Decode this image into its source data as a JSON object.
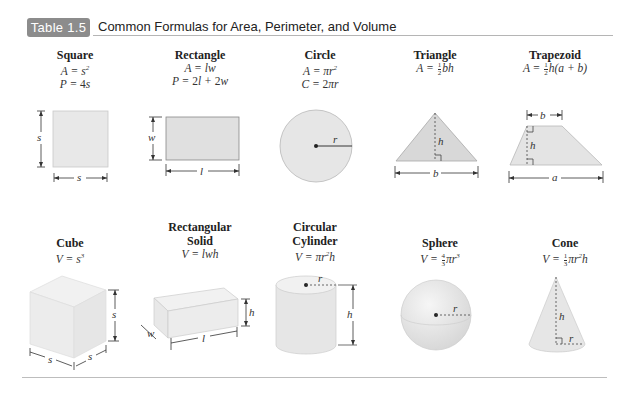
{
  "header": {
    "badge": "Table 1.5",
    "title": "Common Formulas for Area, Perimeter, and Volume"
  },
  "row1": [
    {
      "name": "Square",
      "formulas": [
        "A = s²",
        "P = 4s"
      ],
      "labels": {
        "side_v": "s",
        "side_h": "s"
      }
    },
    {
      "name": "Rectangle",
      "formulas": [
        "A = lw",
        "P = 2l + 2w"
      ],
      "labels": {
        "width": "w",
        "length": "l"
      }
    },
    {
      "name": "Circle",
      "formulas": [
        "A = πr²",
        "C = 2πr"
      ],
      "labels": {
        "radius": "r"
      }
    },
    {
      "name": "Triangle",
      "formulas": [
        "A = ½bh"
      ],
      "labels": {
        "height": "h",
        "base": "b"
      }
    },
    {
      "name": "Trapezoid",
      "formulas": [
        "A = ½h(a + b)"
      ],
      "labels": {
        "top": "b",
        "height": "h",
        "bottom": "a"
      }
    }
  ],
  "row2": [
    {
      "name": "Cube",
      "formulas": [
        "V = s³"
      ],
      "labels": {
        "height": "s",
        "front": "s",
        "side": "s"
      }
    },
    {
      "name": "Rectangular Solid",
      "name_lines": [
        "Rectangular",
        "Solid"
      ],
      "formulas": [
        "V = lwh"
      ],
      "labels": {
        "height": "h",
        "width": "w",
        "length": "l"
      }
    },
    {
      "name": "Circular Cylinder",
      "name_lines": [
        "Circular",
        "Cylinder"
      ],
      "formulas": [
        "V = πr²h"
      ],
      "labels": {
        "radius": "r",
        "height": "h"
      }
    },
    {
      "name": "Sphere",
      "formulas": [
        "V = ⁴⁄₃πr³"
      ],
      "labels": {
        "radius": "r"
      }
    },
    {
      "name": "Cone",
      "formulas": [
        "V = ⅓πr²h"
      ],
      "labels": {
        "height": "h",
        "radius": "r"
      }
    }
  ],
  "colors": {
    "badge_bg": "#8c8c8c",
    "shape_fill": "#e6e6e6",
    "shape_stroke": "#b8b8b8"
  }
}
